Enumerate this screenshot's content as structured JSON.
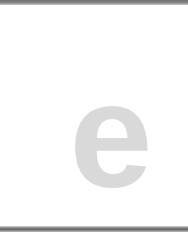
{
  "logo": {
    "letter": "e",
    "color": "#d9d9d9"
  },
  "frame": {
    "border_color": "#737373",
    "background": "#ffffff"
  }
}
